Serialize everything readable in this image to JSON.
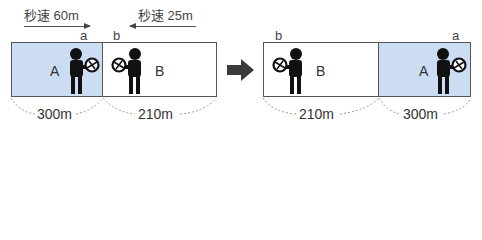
{
  "before": {
    "speed_a": {
      "label": "秒速 60m",
      "direction": "right"
    },
    "speed_b": {
      "label": "秒速 25m",
      "direction": "left"
    },
    "end_a": "a",
    "end_b": "b",
    "train_a": {
      "name": "A",
      "length": "300m",
      "fill": "#cbdcf3"
    },
    "train_b": {
      "name": "B",
      "length": "210m",
      "fill": "#ffffff"
    }
  },
  "transition": {
    "icon": "right-arrow-icon",
    "color": "#3a3a3a"
  },
  "after": {
    "end_b": "b",
    "end_a": "a",
    "train_b": {
      "name": "B",
      "length": "210m",
      "fill": "#ffffff"
    },
    "train_a": {
      "name": "A",
      "length": "300m",
      "fill": "#cbdcf3"
    }
  }
}
